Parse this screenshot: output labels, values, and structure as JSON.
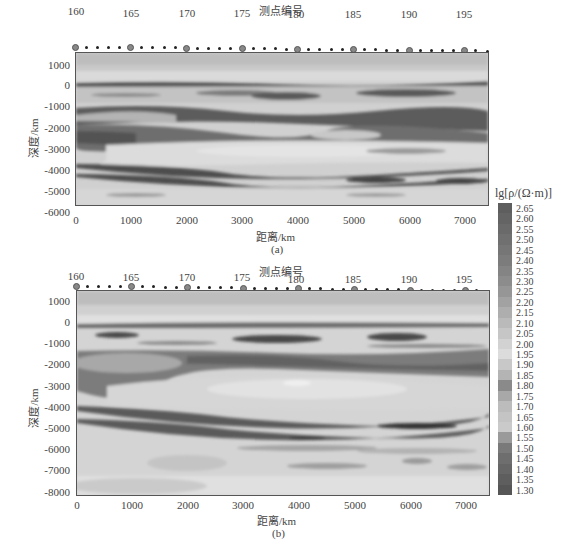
{
  "colorbar": {
    "title": "lg[ρ/(Ω·m)]",
    "labels": [
      "2.65",
      "2.60",
      "2.55",
      "2.50",
      "2.45",
      "2.40",
      "2.35",
      "2.30",
      "2.25",
      "2.20",
      "2.15",
      "2.10",
      "2.05",
      "2.00",
      "1.95",
      "1.90",
      "1.85",
      "1.80",
      "1.75",
      "1.70",
      "1.65",
      "1.60",
      "1.55",
      "1.50",
      "1.45",
      "1.40",
      "1.35",
      "1.30"
    ],
    "colors": [
      "#5e5e5e",
      "#646464",
      "#6a6a6a",
      "#707070",
      "#767676",
      "#7c7c7c",
      "#848484",
      "#8c8c8c",
      "#969696",
      "#a2a2a2",
      "#aeaeae",
      "#bababa",
      "#c6c6c6",
      "#d2d2d2",
      "#dcdcdc",
      "#c8c8c8",
      "#b4b4b4",
      "#8a8a8a",
      "#a8a8a8",
      "#bcbcbc",
      "#c4c4c4",
      "#cacaca",
      "#9a9a9a",
      "#7a7a7a",
      "#6e6e6e",
      "#666666",
      "#5e5e5e",
      "#565656"
    ]
  },
  "chart_data": [
    {
      "type": "heatmap",
      "panel": "(a)",
      "title": "测点编号",
      "xlabel": "距离/km",
      "ylabel": "深度/km",
      "x_ticks": [
        0,
        1000,
        2000,
        3000,
        4000,
        5000,
        6000,
        7000
      ],
      "y_ticks": [
        1000,
        0,
        -1000,
        -2000,
        -3000,
        -4000,
        -5000,
        -6000
      ],
      "xlim": [
        0,
        7400
      ],
      "ylim": [
        -6200,
        1600
      ],
      "station_labels": [
        160,
        165,
        170,
        175,
        180,
        185,
        190,
        195
      ],
      "station_range": [
        160,
        197
      ],
      "colorbar_range": [
        1.3,
        2.65
      ],
      "colorbar_label": "lg[ρ/(Ω·m)]",
      "description": "2D resistivity inversion section; low-resistivity (dark) layers near 0 km, -2000 to -3000 km, and undulating conductive bands near -4500 to -5000 km"
    },
    {
      "type": "heatmap",
      "panel": "(b)",
      "title": "测点编号",
      "xlabel": "距离/km",
      "ylabel": "深度/km",
      "x_ticks": [
        0,
        1000,
        2000,
        3000,
        4000,
        5000,
        6000,
        7000
      ],
      "y_ticks": [
        1000,
        0,
        -1000,
        -2000,
        -3000,
        -4000,
        -5000,
        -6000,
        -7000,
        -8000
      ],
      "xlim": [
        0,
        7400
      ],
      "ylim": [
        -8000,
        1600
      ],
      "station_labels": [
        160,
        165,
        170,
        175,
        180,
        185,
        190,
        195
      ],
      "station_range": [
        160,
        197
      ],
      "colorbar_range": [
        1.3,
        2.65
      ],
      "colorbar_label": "lg[ρ/(Ω·m)]",
      "description": "2D resistivity inversion section extended to -8000 km; conductive layer -1500 to -3000 km, dipping conductive bands -4000 to -5000 km"
    }
  ],
  "panels": {
    "a": {
      "station_title": "测点编号",
      "station_labels": [
        "160",
        "165",
        "170",
        "175",
        "180",
        "185",
        "190",
        "195"
      ],
      "y_labels": [
        "1000",
        "0",
        "-1000",
        "-2000",
        "-3000",
        "-4000",
        "-5000",
        "-6000"
      ],
      "x_labels": [
        "0",
        "1000",
        "2000",
        "3000",
        "4000",
        "5000",
        "6000",
        "7000"
      ],
      "xlabel": "距离/km",
      "ylabel": "深度/km",
      "caption": "(a)"
    },
    "b": {
      "station_title": "测点编号",
      "station_labels": [
        "160",
        "165",
        "170",
        "175",
        "180",
        "185",
        "190",
        "195"
      ],
      "y_labels": [
        "1000",
        "0",
        "-1000",
        "-2000",
        "-3000",
        "-4000",
        "-5000",
        "-6000",
        "-7000",
        "-8000"
      ],
      "x_labels": [
        "0",
        "1000",
        "2000",
        "3000",
        "4000",
        "5000",
        "6000",
        "7000"
      ],
      "xlabel": "距离/km",
      "ylabel": "深度/km",
      "caption": "(b)"
    }
  }
}
